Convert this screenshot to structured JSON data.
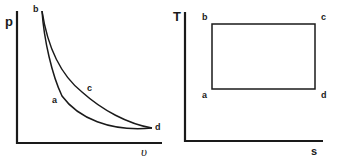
{
  "diagrams": {
    "pv": {
      "y_axis_label": "p",
      "x_axis_label": "υ",
      "points": {
        "a": "a",
        "b": "b",
        "c": "c",
        "d": "d"
      }
    },
    "ts": {
      "y_axis_label": "T",
      "x_axis_label": "s",
      "points": {
        "a": "a",
        "b": "b",
        "c": "c",
        "d": "d"
      }
    }
  },
  "colors": {
    "line": "#1a1a1a",
    "background": "#ffffff"
  }
}
